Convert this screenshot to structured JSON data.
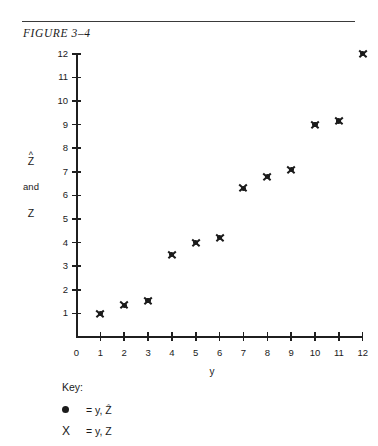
{
  "figure": {
    "title": "FIGURE  3–4",
    "rule": "horizontal-rule"
  },
  "chart_data": {
    "type": "scatter",
    "title": "FIGURE  3–4",
    "xlabel": "y",
    "ylabel": "Ẑ and Z",
    "ylabel_lines": [
      "Ẑ",
      "and",
      "Z"
    ],
    "xlim": [
      0,
      12
    ],
    "ylim": [
      0,
      12
    ],
    "xticks": [
      0,
      1,
      2,
      3,
      4,
      5,
      6,
      7,
      8,
      9,
      10,
      11,
      12
    ],
    "yticks": [
      1,
      2,
      3,
      4,
      5,
      6,
      7,
      8,
      9,
      10,
      11,
      12
    ],
    "grid": false,
    "legend_position": "below-axes-left",
    "x": [
      1,
      2,
      3,
      4,
      5,
      6,
      7,
      8,
      9,
      10,
      11,
      12
    ],
    "series": [
      {
        "name": "y, Ẑ",
        "marker": "filled-circle",
        "color": "#1b1b1b",
        "values": [
          1.0,
          1.35,
          1.55,
          3.5,
          4.0,
          4.2,
          6.3,
          6.8,
          7.1,
          9.0,
          9.15,
          12.0
        ]
      },
      {
        "name": "y, Z",
        "marker": "x-cross",
        "color": "#1b1b1b",
        "values": [
          1.0,
          1.35,
          1.55,
          3.5,
          4.0,
          4.2,
          6.3,
          6.8,
          7.1,
          9.0,
          9.15,
          12.0
        ]
      }
    ],
    "note": "Both series overlap at every x, so each plotted point renders as an X superimposed on a dot."
  },
  "axes": {
    "x_tick_labels": [
      "0",
      "1",
      "2",
      "3",
      "4",
      "5",
      "6",
      "7",
      "8",
      "9",
      "10",
      "11",
      "12"
    ],
    "y_tick_labels": [
      "1",
      "2",
      "3",
      "4",
      "5",
      "6",
      "7",
      "8",
      "9",
      "10",
      "11",
      "12"
    ],
    "x_title": "y",
    "y_title_top": "Z",
    "y_title_hat": "^",
    "y_title_mid": "and",
    "y_title_bottom": "Z"
  },
  "key": {
    "title": "Key:",
    "entries": [
      {
        "marker": "filled-circle",
        "glyph": "●",
        "text": "=  y, Ẑ"
      },
      {
        "marker": "x-cross",
        "glyph": "X",
        "text": "=  y, Z"
      }
    ]
  }
}
